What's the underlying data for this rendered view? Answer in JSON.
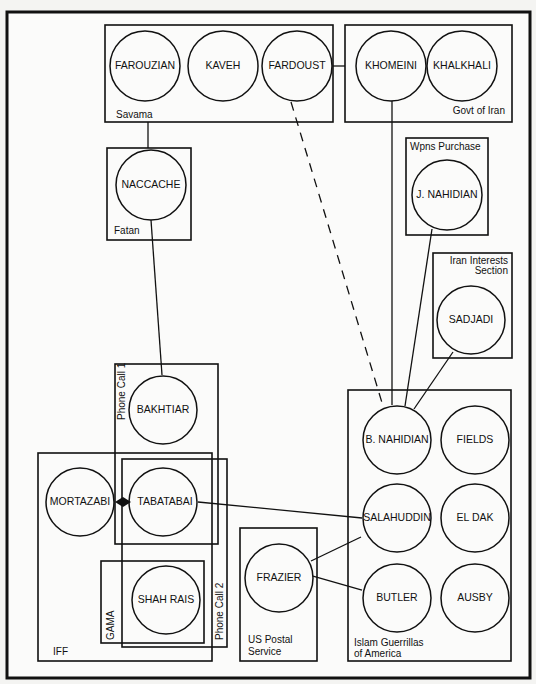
{
  "diagram": {
    "type": "network",
    "groups": [
      {
        "id": "savama",
        "label": "Savama",
        "members": [
          "FAROUZIAN",
          "KAVEH",
          "FARDOUST"
        ]
      },
      {
        "id": "govt",
        "label": "Govt of Iran",
        "members": [
          "KHOMEINI",
          "KHALKHALI"
        ]
      },
      {
        "id": "fatan",
        "label": "Fatan",
        "members": [
          "NACCACHE"
        ]
      },
      {
        "id": "wpns",
        "label": "Wpns Purchase",
        "members": [
          "J. NAHIDIAN"
        ]
      },
      {
        "id": "iis",
        "label_line1": "Iran Interests",
        "label_line2": "Section",
        "members": [
          "SADJADI"
        ]
      },
      {
        "id": "phone1",
        "label": "Phone Call 1",
        "members": [
          "BAKHTIAR",
          "TABATABAI"
        ]
      },
      {
        "id": "iff",
        "label": "IFF",
        "members": [
          "MORTAZABI",
          "TABATABAI",
          "SHAH RAIS"
        ]
      },
      {
        "id": "phone2",
        "label": "Phone Call 2",
        "members": [
          "TABATABAI",
          "SHAH RAIS"
        ]
      },
      {
        "id": "gama",
        "label": "GAMA",
        "members": [
          "SHAH RAIS"
        ]
      },
      {
        "id": "usps",
        "label_line1": "US Postal",
        "label_line2": "Service",
        "members": [
          "FRAZIER"
        ]
      },
      {
        "id": "iga",
        "label_line1": "Islam Guerrillas",
        "label_line2": "of America",
        "members": [
          "B. NAHIDIAN",
          "FIELDS",
          "SALAHUDDIN",
          "EL DAK",
          "BUTLER",
          "AUSBY"
        ]
      }
    ],
    "nodes": {
      "farouzian": "FAROUZIAN",
      "kaveh": "KAVEH",
      "fardoust": "FARDOUST",
      "khomeini": "KHOMEINI",
      "khalkhali": "KHALKHALI",
      "naccache": "NACCACHE",
      "jnahidian": "J. NAHIDIAN",
      "sadjadi": "SADJADI",
      "bakhtiar": "BAKHTIAR",
      "mortazabi": "MORTAZABI",
      "tabatabai": "TABATABAI",
      "shahrais": "SHAH RAIS",
      "frazier": "FRAZIER",
      "bnahidian": "B. NAHIDIAN",
      "fields": "FIELDS",
      "salahuddin": "SALAHUDDIN",
      "eldak": "EL DAK",
      "butler": "BUTLER",
      "ausby": "AUSBY"
    },
    "edges": [
      {
        "from": "Savama",
        "to": "Govt of Iran",
        "style": "solid"
      },
      {
        "from": "Savama",
        "to": "NACCACHE",
        "style": "solid"
      },
      {
        "from": "NACCACHE",
        "to": "BAKHTIAR",
        "style": "solid"
      },
      {
        "from": "FARDOUST",
        "to": "B. NAHIDIAN",
        "style": "dashed"
      },
      {
        "from": "KHOMEINI",
        "to": "B. NAHIDIAN",
        "style": "solid"
      },
      {
        "from": "J. NAHIDIAN",
        "to": "B. NAHIDIAN",
        "style": "solid"
      },
      {
        "from": "SADJADI",
        "to": "B. NAHIDIAN",
        "style": "solid"
      },
      {
        "from": "MORTAZABI",
        "to": "TABATABAI",
        "style": "bidirectional-arrow"
      },
      {
        "from": "TABATABAI",
        "to": "SALAHUDDIN",
        "style": "solid"
      },
      {
        "from": "FRAZIER",
        "to": "SALAHUDDIN",
        "style": "solid"
      },
      {
        "from": "FRAZIER",
        "to": "BUTLER",
        "style": "solid"
      }
    ]
  }
}
